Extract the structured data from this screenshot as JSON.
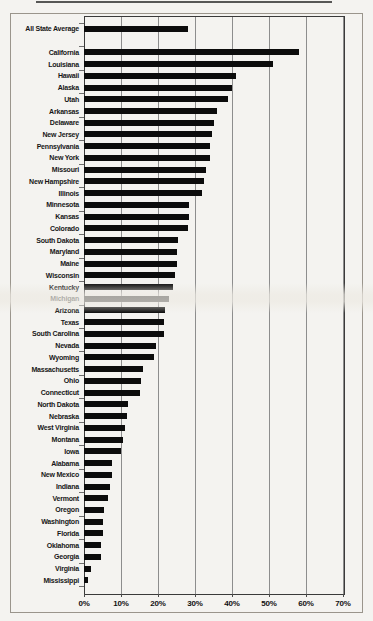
{
  "page": {
    "background_color": "#f4f3f0"
  },
  "chart_data": {
    "type": "bar",
    "orientation": "horizontal",
    "title": "",
    "xlabel": "",
    "ylabel": "",
    "grid": true,
    "legend": false,
    "bar_color": "#0c0c0c",
    "gridline_color": "#8d8d8d",
    "xlim": [
      0,
      70
    ],
    "x_tick_labels": [
      "0%",
      "10%",
      "20%",
      "30%",
      "40%",
      "50%",
      "60%",
      "70%"
    ],
    "categories": [
      "All State Average",
      "",
      "California",
      "Louisiana",
      "Hawaii",
      "Alaska",
      "Utah",
      "Arkansas",
      "Delaware",
      "New Jersey",
      "Pennsylvania",
      "New York",
      "Missouri",
      "New Hampshire",
      "Illinois",
      "Minnesota",
      "Kansas",
      "Colorado",
      "South Dakota",
      "Maryland",
      "Maine",
      "Wisconsin",
      "Kentucky",
      "Michigan",
      "Arizona",
      "Texas",
      "South Carolina",
      "Nevada",
      "Wyoming",
      "Massachusetts",
      "Ohio",
      "Connecticut",
      "North Dakota",
      "Nebraska",
      "West Virginia",
      "Montana",
      "Iowa",
      "Alabama",
      "New Mexico",
      "Indiana",
      "Vermont",
      "Oregon",
      "Washington",
      "Florida",
      "Oklahoma",
      "Georgia",
      "Virginia",
      "Mississippi"
    ],
    "values": [
      28,
      null,
      58,
      51,
      41,
      40,
      39,
      36,
      35,
      34.5,
      34,
      34,
      33,
      32.5,
      32,
      28.5,
      28.5,
      28,
      25.5,
      25,
      25,
      24.5,
      24,
      23,
      22,
      21.5,
      21.5,
      19.5,
      19,
      16,
      15.5,
      15,
      12,
      11.5,
      11,
      10.5,
      10,
      7.5,
      7.5,
      7,
      6.5,
      5.5,
      5,
      5,
      4.5,
      4.5,
      2,
      1
    ]
  }
}
